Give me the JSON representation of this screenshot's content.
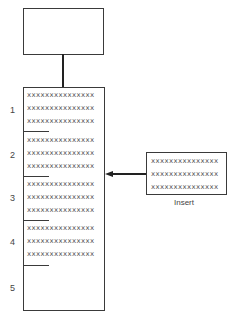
{
  "diagram": {
    "top_box": {
      "label": ""
    },
    "list": {
      "slots": [
        {
          "number": "1",
          "rows": [
            "xxxxxxxxxxxxxxx",
            "xxxxxxxxxxxxxxx",
            "xxxxxxxxxxxxxxx"
          ]
        },
        {
          "number": "2",
          "rows": [
            "xxxxxxxxxxxxxxx",
            "xxxxxxxxxxxxxxx",
            "xxxxxxxxxxxxxxx"
          ]
        },
        {
          "number": "3",
          "rows": [
            "xxxxxxxxxxxxxxx",
            "xxxxxxxxxxxxxxx",
            "xxxxxxxxxxxxxxx"
          ]
        },
        {
          "number": "4",
          "rows": [
            "xxxxxxxxxxxxxxx",
            "xxxxxxxxxxxxxxx",
            "xxxxxxxxxxxxxxx"
          ]
        },
        {
          "number": "5",
          "rows": []
        }
      ]
    },
    "insert_box": {
      "rows": [
        "xxxxxxxxxxxxxxx",
        "xxxxxxxxxxxxxxx",
        "xxxxxxxxxxxxxxx"
      ],
      "caption": "Insert"
    },
    "arrow": {
      "direction": "left",
      "target_slot": "between 2 and 3"
    }
  }
}
